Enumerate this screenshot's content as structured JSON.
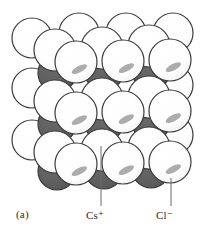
{
  "figure": {
    "panel_label": "(a)",
    "title_implied": "CsCl crystal structure",
    "colors": {
      "anion_fill": "#ffffff",
      "anion_stroke": "#3a3a3a",
      "cation_fill": "#5e5e5e",
      "cation_stroke": "#3a3a3a",
      "highlight": "#a8a8a8",
      "leader_line": "#6b6b6b",
      "text": "#2b2b2b",
      "background": "#ffffff"
    },
    "legend": [
      {
        "id": "cation",
        "label": "Cs",
        "charge": "+",
        "text": "Cs⁺",
        "swatch": "#5e5e5e"
      },
      {
        "id": "anion",
        "label": "Cl",
        "charge": "−",
        "text": "Cl⁻",
        "swatch": "#ffffff"
      }
    ],
    "leaders": [
      {
        "target": "cation",
        "x": 101,
        "y_top": 146,
        "y_bottom": 206
      },
      {
        "target": "anion",
        "x": 171,
        "y_top": 178,
        "y_bottom": 206
      }
    ],
    "spheres": {
      "radius_front": 21,
      "radius_back": 20,
      "radius_cation": 19,
      "back_layer": [
        {
          "cx": 32,
          "cy": 38
        },
        {
          "cx": 79,
          "cy": 33
        },
        {
          "cx": 126,
          "cy": 33
        },
        {
          "cx": 32,
          "cy": 88
        },
        {
          "cx": 79,
          "cy": 85
        },
        {
          "cx": 126,
          "cy": 83
        },
        {
          "cx": 32,
          "cy": 140
        },
        {
          "cx": 79,
          "cy": 137
        },
        {
          "cx": 126,
          "cy": 135
        },
        {
          "cx": 173,
          "cy": 33
        },
        {
          "cx": 173,
          "cy": 85
        },
        {
          "cx": 173,
          "cy": 135
        }
      ],
      "mid_layer": [
        {
          "cx": 55,
          "cy": 50
        },
        {
          "cx": 102,
          "cy": 48
        },
        {
          "cx": 149,
          "cy": 46
        },
        {
          "cx": 55,
          "cy": 101
        },
        {
          "cx": 102,
          "cy": 99
        },
        {
          "cx": 149,
          "cy": 97
        },
        {
          "cx": 55,
          "cy": 152
        },
        {
          "cx": 102,
          "cy": 150
        },
        {
          "cx": 149,
          "cy": 148
        }
      ],
      "cations": [
        {
          "cx": 57,
          "cy": 73
        },
        {
          "cx": 104,
          "cy": 72
        },
        {
          "cx": 151,
          "cy": 71
        },
        {
          "cx": 57,
          "cy": 124
        },
        {
          "cx": 104,
          "cy": 123
        },
        {
          "cx": 151,
          "cy": 122
        },
        {
          "cx": 57,
          "cy": 171
        },
        {
          "cx": 104,
          "cy": 170
        },
        {
          "cx": 151,
          "cy": 169
        }
      ],
      "front_layer": [
        {
          "cx": 76,
          "cy": 62
        },
        {
          "cx": 123,
          "cy": 61
        },
        {
          "cx": 170,
          "cy": 60
        },
        {
          "cx": 76,
          "cy": 113
        },
        {
          "cx": 123,
          "cy": 112
        },
        {
          "cx": 170,
          "cy": 111
        },
        {
          "cx": 76,
          "cy": 164
        },
        {
          "cx": 123,
          "cy": 163
        },
        {
          "cx": 170,
          "cy": 162
        }
      ]
    }
  }
}
